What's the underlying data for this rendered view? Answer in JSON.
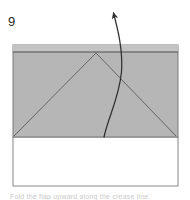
{
  "figure": {
    "step_number": "9",
    "caption_fragment": "Fold the flap upward along the crease line.",
    "colors": {
      "paper_fill": "#b6b6b6",
      "paper_band_fill": "#c0c0c0",
      "paper_back_fill": "#ffffff",
      "outline": "#6f6f6f",
      "fold_line": "#5a5a5a",
      "arrow": "#2f2f2f",
      "label": "#2b2b2b",
      "caption": "#c9c9c9",
      "background": "#ffffff"
    },
    "shapes": {
      "shaded_panel": {
        "name": "shaded-panel",
        "x": 13,
        "y": 45,
        "width": 165,
        "height": 92
      },
      "top_band": {
        "name": "top-band",
        "x": 13,
        "y": 45,
        "width": 165,
        "height": 7
      },
      "white_panel": {
        "name": "white-panel",
        "x": 13,
        "y": 137,
        "width": 165,
        "height": 49
      },
      "fold_line_left": {
        "name": "fold-line-left",
        "x1": 14,
        "y1": 136,
        "x2": 96,
        "y2": 53
      },
      "fold_line_right": {
        "name": "fold-line-right",
        "x1": 96,
        "y1": 53,
        "x2": 176,
        "y2": 136
      },
      "horizontal_crease": {
        "name": "horizontal-crease",
        "x1": 13,
        "y1": 52,
        "x2": 178,
        "y2": 52
      },
      "motion_arrow": {
        "name": "motion-arrow",
        "path": "M 104 137 C 108 118, 118 96, 121 70 C 122 52, 118 32, 113 12",
        "tip_x": 112,
        "tip_y": 8,
        "direction": "up-left"
      }
    },
    "labels": {
      "step_label_x": 9,
      "step_label_y": 25
    }
  }
}
